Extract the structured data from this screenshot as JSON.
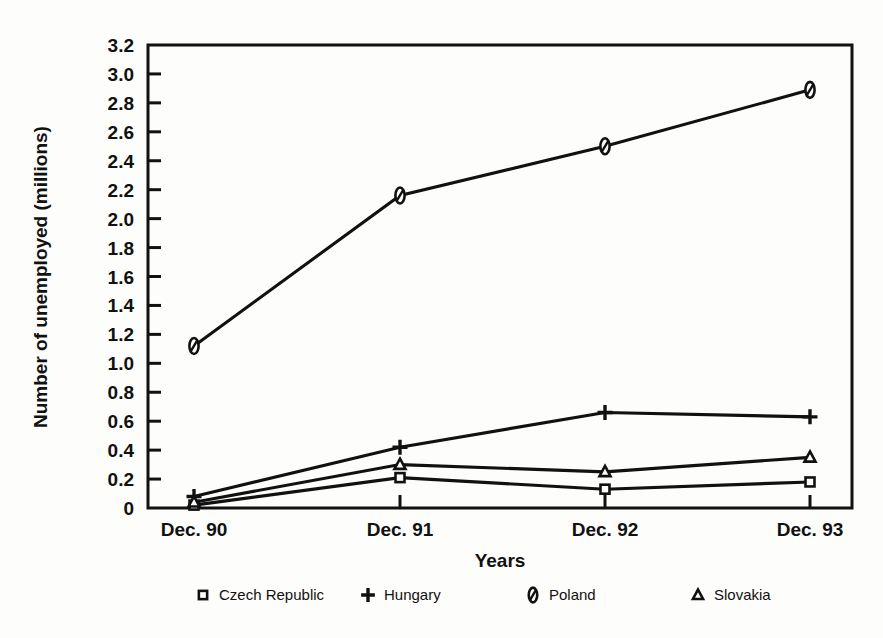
{
  "chart_data": {
    "type": "line",
    "title": "",
    "xlabel": "Years",
    "ylabel": "Number of unemployed (millions)",
    "categories": [
      "Dec. 90",
      "Dec. 91",
      "Dec. 92",
      "Dec. 93"
    ],
    "ylim": [
      0,
      3.2
    ],
    "yticks": [
      "0",
      "0.2",
      "0.4",
      "0.6",
      "0.8",
      "1.0",
      "1.2",
      "1.4",
      "1.6",
      "1.8",
      "2.0",
      "2.2",
      "2.4",
      "2.6",
      "2.8",
      "3.0",
      "3.2"
    ],
    "ytick_values": [
      0,
      0.2,
      0.4,
      0.6,
      0.8,
      1.0,
      1.2,
      1.4,
      1.6,
      1.8,
      2.0,
      2.2,
      2.4,
      2.6,
      2.8,
      3.0,
      3.2
    ],
    "grid": false,
    "legend_position": "bottom",
    "series": [
      {
        "name": "Czech Republic",
        "marker": "square",
        "values": [
          0.02,
          0.21,
          0.13,
          0.18
        ]
      },
      {
        "name": "Hungary",
        "marker": "plus",
        "values": [
          0.08,
          0.42,
          0.66,
          0.63
        ]
      },
      {
        "name": "Poland",
        "marker": "slashed-zero",
        "values": [
          1.12,
          2.16,
          2.5,
          2.89
        ]
      },
      {
        "name": "Slovakia",
        "marker": "triangle",
        "values": [
          0.04,
          0.3,
          0.25,
          0.35
        ]
      }
    ],
    "colors": {
      "line": "#111111",
      "background": "#fdfdfb",
      "axis": "#111111"
    }
  },
  "legend": {
    "items": [
      {
        "label": "Czech Republic",
        "marker": "square"
      },
      {
        "label": "Hungary",
        "marker": "plus"
      },
      {
        "label": "Poland",
        "marker": "slashed-zero"
      },
      {
        "label": "Slovakia",
        "marker": "triangle"
      }
    ]
  }
}
